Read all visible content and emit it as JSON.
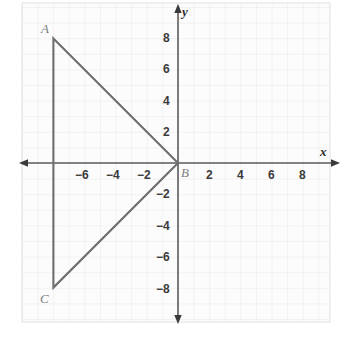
{
  "chart_data": {
    "type": "scatter",
    "title": "",
    "subtitle": "",
    "xlabel": "x",
    "ylabel": "y",
    "xlim": [
      -10,
      10
    ],
    "ylim": [
      -10,
      10
    ],
    "grid": true,
    "grid_step": 1,
    "legend": "none",
    "x_ticks": [
      -6,
      -4,
      -2,
      2,
      4,
      6,
      8
    ],
    "x_tick_labels": [
      "−6",
      "−4",
      "−2",
      "2",
      "4",
      "6",
      "8"
    ],
    "y_ticks": [
      8,
      6,
      4,
      2,
      -2,
      -4,
      -6,
      -8
    ],
    "y_tick_labels": [
      "8",
      "6",
      "4",
      "2",
      "−2",
      "−4",
      "−6",
      "−8"
    ],
    "points": [
      {
        "label": "A",
        "x": -8,
        "y": 8
      },
      {
        "label": "B",
        "x": 0,
        "y": 0
      },
      {
        "label": "C",
        "x": -8,
        "y": -8
      }
    ],
    "shapes": [
      {
        "name": "triangle-ABC",
        "type": "polygon",
        "closed": true,
        "vertices": [
          [
            -8,
            8
          ],
          [
            0,
            0
          ],
          [
            -8,
            -8
          ]
        ],
        "stroke": "#6f6f6f",
        "fill": "none"
      }
    ],
    "annotations": [
      {
        "text": "A",
        "x": -8.6,
        "y": 8.9
      },
      {
        "text": "B",
        "x": 0.3,
        "y": -0.55
      },
      {
        "text": "C",
        "x": -8.7,
        "y": -9.0
      }
    ]
  },
  "colors": {
    "background": "#ffffff",
    "plot_background": "#fcfcfc",
    "grid": "#e7e7e7",
    "axis": "#5c5c5c",
    "shape_stroke": "#6f6f6f",
    "tick_text": "#3b3b3b",
    "vertex_text": "#7c7c7c",
    "axis_label_text": "#2b2b2b"
  },
  "axis_labels": {
    "x": "x",
    "y": "y"
  },
  "vertex_labels": {
    "a": "A",
    "b": "B",
    "c": "C"
  },
  "x_tick_labels": {
    "neg6": "−6",
    "neg4": "−4",
    "neg2": "−2",
    "pos2": "2",
    "pos4": "4",
    "pos6": "6",
    "pos8": "8"
  },
  "y_tick_labels": {
    "pos8": "8",
    "pos6": "6",
    "pos4": "4",
    "pos2": "2",
    "neg2": "−2",
    "neg4": "−4",
    "neg6": "−6",
    "neg8": "−8"
  }
}
